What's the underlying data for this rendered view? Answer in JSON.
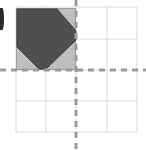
{
  "figure": {
    "canvas": {
      "width": 146,
      "height": 150,
      "background": "#ffffff"
    },
    "grid": {
      "line_color": "#d9d9d9",
      "line_width": 1,
      "x_lines": [
        16,
        46,
        76,
        107,
        137
      ],
      "y_lines": [
        7,
        39,
        70,
        101,
        132
      ],
      "columns": 4,
      "rows": 4,
      "cell_width": 30,
      "cell_height": 31
    },
    "axes": {
      "style": "dashed",
      "color": "#9a9a9a",
      "line_width": 3,
      "dash_pattern": "6 5",
      "x_axis": {
        "label": "x-axis",
        "y": 70,
        "x_start": 0,
        "x_end": 146
      },
      "y_axis": {
        "label": "y-axis",
        "x": 76,
        "y_start": 0,
        "y_end": 150
      },
      "origin": {
        "x": 76,
        "y": 70
      }
    },
    "shapes": [
      {
        "name": "light-gray-square",
        "kind": "square",
        "fill": "#bfbfbf",
        "stroke": "#9e9e9e",
        "stroke_width": 1,
        "x": 16,
        "y": 8,
        "width": 60,
        "height": 62,
        "quadrant": "upper-left"
      },
      {
        "name": "dark-gray-polygon",
        "kind": "rotated-square",
        "fill": "#4f4f4f",
        "stroke": "#3a3a3a",
        "stroke_width": 1,
        "points": "17,9 57,9 76,31 76,40 46,69 39,69 17,47",
        "description": "Dark rotated square overlapping the shaded square"
      }
    ],
    "edge_marker": {
      "name": "left-edge-bullet",
      "color": "#2b2b2b",
      "description": "partial dark glyph clipped at left edge"
    }
  }
}
